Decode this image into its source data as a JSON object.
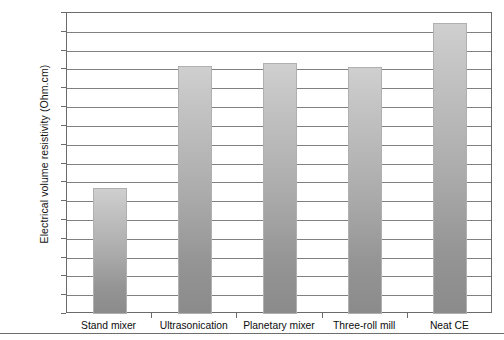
{
  "chart_data": {
    "type": "bar",
    "title": "",
    "xlabel": "",
    "ylabel": "Electrical volume resistivity (Ohm.cm)",
    "yscale": "log",
    "ylim": [
      1,
      1e+16
    ],
    "grid": true,
    "legend": null,
    "categories": [
      "Stand mixer",
      "Ultrasonication",
      "Planetary mixer",
      "Three-roll mill",
      "Neat CE"
    ],
    "values": [
      5000000.0,
      16000000000000.0,
      22000000000000.0,
      14000000000000.0,
      3000000000000000.0
    ],
    "value_labels": [
      "5.0E+06",
      "1.6E+13",
      "2.2E+13",
      "1.4E+13",
      "3.0E+15"
    ],
    "ytick_labels": [
      "1.00E+16",
      "1.00E+15",
      "1.00E+14",
      "1.00E+13",
      "1.00E+12",
      "1.00E+11",
      "1.00E+10",
      "1.00E+09",
      "1.00E+08",
      "1.00E+07",
      "1.00E+06",
      "1.00E+05",
      "1.00E+04",
      "1.00E+03",
      "1.00E+02",
      "1.00E+01",
      "1.00E+00"
    ],
    "colors": {
      "bar_top": "#cfcfcf",
      "bar_bottom": "#8b8b8b",
      "gridline": "#808080",
      "axis": "#6b6b6b",
      "background": "#ffffff",
      "text": "#0d0d0d"
    }
  }
}
